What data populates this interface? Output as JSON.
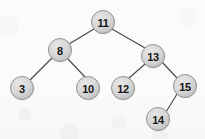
{
  "diagram": {
    "type": "binary-search-tree",
    "canvas": {
      "width": 205,
      "height": 139
    },
    "style": {
      "background_color": "#fbfbfa",
      "node_fill_light": "#dedede",
      "node_fill_dark": "#c2c2c2",
      "node_stroke_color": "#8a8a8a",
      "edge_color": "#4a4a4a",
      "label_color": "#151515",
      "node_radius": 11.5
    },
    "nodes": [
      {
        "id": "n11",
        "label": "11",
        "cx": 103,
        "cy": 22,
        "r": 11.5,
        "depth": 0,
        "role": "root"
      },
      {
        "id": "n8",
        "label": "8",
        "cx": 60,
        "cy": 50,
        "r": 11.5,
        "depth": 1,
        "role": "left-child"
      },
      {
        "id": "n13",
        "label": "13",
        "cx": 153,
        "cy": 56,
        "r": 11.5,
        "depth": 1,
        "role": "right-child"
      },
      {
        "id": "n3",
        "label": "3",
        "cx": 22,
        "cy": 88,
        "r": 11.5,
        "depth": 2,
        "role": "leaf"
      },
      {
        "id": "n10",
        "label": "10",
        "cx": 88,
        "cy": 88,
        "r": 11.5,
        "depth": 2,
        "role": "leaf"
      },
      {
        "id": "n12",
        "label": "12",
        "cx": 123,
        "cy": 88,
        "r": 11.5,
        "depth": 2,
        "role": "leaf"
      },
      {
        "id": "n15",
        "label": "15",
        "cx": 185,
        "cy": 86,
        "r": 11.5,
        "depth": 2,
        "role": "internal"
      },
      {
        "id": "n14",
        "label": "14",
        "cx": 158,
        "cy": 119,
        "r": 11.5,
        "depth": 3,
        "role": "leaf"
      }
    ],
    "edges": [
      {
        "id": "e-11-8",
        "from": "n11",
        "to": "n8",
        "x1": 94,
        "y1": 29,
        "x2": 69,
        "y2": 44
      },
      {
        "id": "e-11-13",
        "from": "n11",
        "to": "n13",
        "x1": 112,
        "y1": 29,
        "x2": 145,
        "y2": 48
      },
      {
        "id": "e-8-3",
        "from": "n8",
        "to": "n3",
        "x1": 52,
        "y1": 58,
        "x2": 30,
        "y2": 80
      },
      {
        "id": "e-8-10",
        "from": "n8",
        "to": "n10",
        "x1": 68,
        "y1": 59,
        "x2": 85,
        "y2": 77
      },
      {
        "id": "e-13-12",
        "from": "n13",
        "to": "n12",
        "x1": 145,
        "y1": 64,
        "x2": 128,
        "y2": 79
      },
      {
        "id": "e-13-15",
        "from": "n13",
        "to": "n15",
        "x1": 162,
        "y1": 62,
        "x2": 177,
        "y2": 78
      },
      {
        "id": "e-15-14",
        "from": "n15",
        "to": "n14",
        "x1": 177,
        "y1": 94,
        "x2": 166,
        "y2": 112
      }
    ]
  }
}
